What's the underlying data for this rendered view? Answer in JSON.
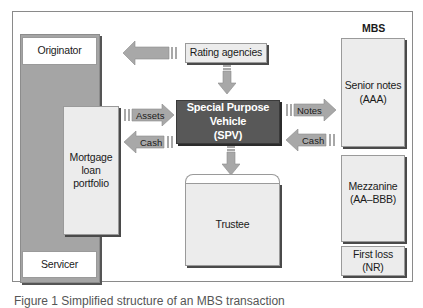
{
  "diagram": {
    "mbs_title": "MBS",
    "originator": "Originator",
    "servicer": "Servicer",
    "mortgage_portfolio": "Mortgage loan portfolio",
    "mortgage_lines": [
      "Mortgage",
      "loan",
      "portfolio"
    ],
    "rating_agencies": "Rating agencies",
    "spv_line1": "Special Purpose Vehicle",
    "spv_line2": "(SPV)",
    "trustee": "Trustee",
    "senior_line1": "Senior notes",
    "senior_line2": "(AAA)",
    "mezz_line1": "Mezzanine",
    "mezz_line2": "(AA–BBB)",
    "first_loss_line1": "First loss",
    "first_loss_line2": "(NR)",
    "arrows": {
      "assets": "Assets",
      "cash_left": "Cash",
      "notes": "Notes",
      "cash_right": "Cash"
    }
  },
  "caption": "Figure 1  Simplified structure of an MBS transaction",
  "colors": {
    "spv_fill": "#585858",
    "column_fill": "#a5a5a5",
    "box_fill": "#ececec",
    "arrow_fill": "#a8a8a8"
  }
}
